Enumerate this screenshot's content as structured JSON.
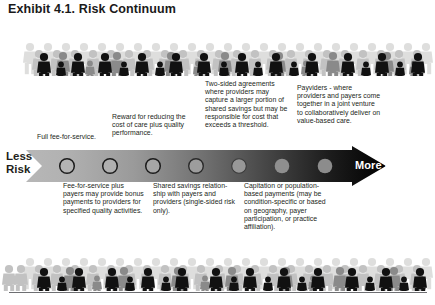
{
  "title": "Exhibit 4.1. Risk Continuum",
  "axis": {
    "left_label_line1": "Less",
    "left_label_line2": "Risk",
    "right_label": "More Risk",
    "marker_count": 7
  },
  "callouts_above": [
    {
      "id": "full-ffs",
      "text": "Full fee-for-service."
    },
    {
      "id": "reward-cost-quality",
      "text": "Reward for reducing the cost of care plus quality performance."
    },
    {
      "id": "two-sided-agreements",
      "text": "Two-sided agreements where providers may capture a larger portion of shared savings but may be responsible for cost that exceeds a threshold."
    },
    {
      "id": "payviders",
      "text": "Payviders - where providers and payers come together in a joint venture to collaboratively deliver on value-based care."
    }
  ],
  "callouts_below": [
    {
      "id": "ffs-plus-bonus",
      "text": "Fee-for-service plus payers may provide bonus payments to providers for specified quality activities."
    },
    {
      "id": "shared-savings",
      "text": "Shared savings relation-ship with payers and providers (single-sided risk only)."
    },
    {
      "id": "capitation",
      "text": "Capitation or population-based payments (may be condition-specific or based on geography, payer participation, or practice affiliation)."
    }
  ],
  "colors": {
    "gradient_start": "#b3b3b3",
    "gradient_end": "#000000",
    "text": "#231f20",
    "rule": "#6d6e71",
    "marker_fill_light": "#b8b8b8",
    "marker_fill_dark": "#8a8a8a",
    "marker_stroke": "#1a1a1a"
  },
  "decor": {
    "crowd_top_name": "people-silhouette-band-top",
    "crowd_bottom_name": "people-silhouette-band-bottom"
  }
}
